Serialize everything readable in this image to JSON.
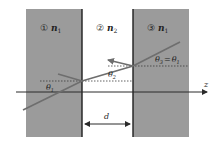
{
  "diagram": {
    "type": "optics-slab-refraction",
    "colors": {
      "slab_fill": "#9b9b9b",
      "boundary": "#1e1e1e",
      "ray": "#6e6e6e",
      "axis": "#2a2a2a",
      "dotted": "#3a3a3a",
      "background": "#ffffff"
    },
    "regions": [
      {
        "id": "region-1",
        "number": "①",
        "index_label": "n",
        "index_sub": "1"
      },
      {
        "id": "region-2",
        "number": "②",
        "index_label": "n",
        "index_sub": "2"
      },
      {
        "id": "region-3",
        "number": "③",
        "index_label": "n",
        "index_sub": "1"
      }
    ],
    "angles": {
      "theta1": {
        "symbol": "θ",
        "sub": "1"
      },
      "theta2": {
        "symbol": "θ",
        "sub": "2"
      },
      "theta3_eq": {
        "lhs_symbol": "θ",
        "lhs_sub": "3",
        "eq": "=",
        "rhs_symbol": "θ",
        "rhs_sub": "1"
      }
    },
    "axis": {
      "label": "z"
    },
    "gap": {
      "label": "d"
    }
  }
}
